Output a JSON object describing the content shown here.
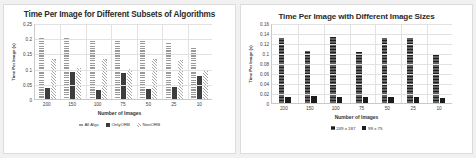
{
  "page": {
    "background_color": "#f1f1f1",
    "panel_color": "#ffffff"
  },
  "chart_data": [
    {
      "type": "bar",
      "title": "Time Per Image for Different Subsets of Algorithms",
      "xlabel": "Number of Images",
      "ylabel": "Time Per Image (s)",
      "categories": [
        "200",
        "150",
        "100",
        "75",
        "50",
        "25",
        "10"
      ],
      "ylim": [
        0,
        0.25
      ],
      "yticks": [
        "0",
        "0.05",
        "0.1",
        "0.15",
        "0.2",
        "0.25"
      ],
      "ytick_values": [
        0,
        0.05,
        0.1,
        0.15,
        0.2,
        0.25
      ],
      "grid": true,
      "legend_position": "bottom",
      "series": [
        {
          "name": "All Algs",
          "color": "#b5b5b5",
          "pattern": "horizontal-stripes",
          "values": [
            0.2,
            0.205,
            0.196,
            0.193,
            0.199,
            0.187,
            0.171
          ]
        },
        {
          "name": "OnlyORB",
          "color": "#3d3d3d",
          "pattern": "solid",
          "values": [
            0.035,
            0.088,
            0.031,
            0.087,
            0.033,
            0.041,
            0.075
          ]
        },
        {
          "name": "NonORB",
          "color": "#d8d8d8",
          "pattern": "diagonal-hatch",
          "values": [
            0.13,
            0.103,
            0.131,
            0.098,
            0.13,
            0.129,
            0.095
          ]
        }
      ]
    },
    {
      "type": "bar",
      "title": "Time Per Image with Different Image Sizes",
      "xlabel": "Number of Images",
      "ylabel": "Time Per Image (s)",
      "categories": [
        "200",
        "150",
        "100",
        "75",
        "50",
        "25",
        "10"
      ],
      "ylim": [
        0,
        0.16
      ],
      "yticks": [
        "0",
        "0.02",
        "0.04",
        "0.06",
        "0.08",
        "0.1",
        "0.12",
        "0.14",
        "0.16"
      ],
      "ytick_values": [
        0,
        0.02,
        0.04,
        0.06,
        0.08,
        0.1,
        0.12,
        0.14,
        0.16
      ],
      "grid": true,
      "legend_position": "bottom",
      "series": [
        {
          "name": "249 x 187",
          "color": "#1c1c1c",
          "pattern": "fine-horizontal",
          "values": [
            0.13,
            0.104,
            0.132,
            0.102,
            0.13,
            0.13,
            0.095
          ]
        },
        {
          "name": "99 x 75",
          "color": "#1c1c1c",
          "pattern": "solid",
          "values": [
            0.012,
            0.013,
            0.011,
            0.011,
            0.012,
            0.011,
            0.01
          ]
        }
      ]
    }
  ]
}
